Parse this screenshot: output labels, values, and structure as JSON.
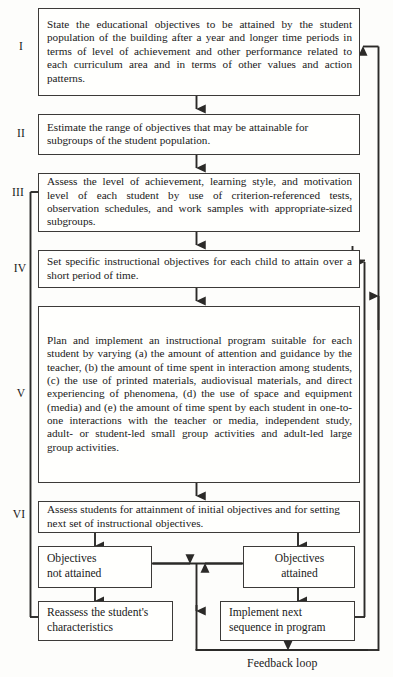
{
  "diagram": {
    "caption": "Feedback loop",
    "stroke_color": "#3c3a38",
    "box_fill": "#fffffd",
    "page_bg": "#fdfdfb"
  },
  "steps": [
    {
      "numeral": "I",
      "text": "State the educational objectives to be attained by the student population of the building after a year and longer time periods in terms of level of achievement and other performance related to each curriculum area and in terms of other values and action patterns."
    },
    {
      "numeral": "II",
      "text": "Estimate the range of objectives that may be attainable for subgroups of the student population."
    },
    {
      "numeral": "III",
      "text": "Assess the level of achievement, learning style, and motivation level of each student by use of criterion-referenced tests, observation schedules, and work samples with appropriate-sized subgroups."
    },
    {
      "numeral": "IV",
      "text": "Set specific instructional objectives for each child to attain over a short period of time."
    },
    {
      "numeral": "V",
      "text": "Plan and implement an instructional program suitable for each student by varying (a) the amount of attention and guidance by the teacher, (b) the amount of time spent in interaction among students, (c) the use of printed materials, audiovisual materials, and direct experiencing of phenomena, (d) the use of space and equipment (media) and (e) the amount of time spent by each student in one-to-one interactions with the teacher or media, independent study, adult- or student-led small group activities and adult-led large group activities."
    },
    {
      "numeral": "VI",
      "text": "Assess students for attainment of initial objectives and for setting next set of instructional objectives."
    }
  ],
  "outcomes": {
    "not_attained": "Objectives\nnot attained",
    "attained": "Objectives\nattained",
    "reassess": "Reassess the student's\ncharacteristics",
    "implement": "Implement next\nsequence in program"
  }
}
